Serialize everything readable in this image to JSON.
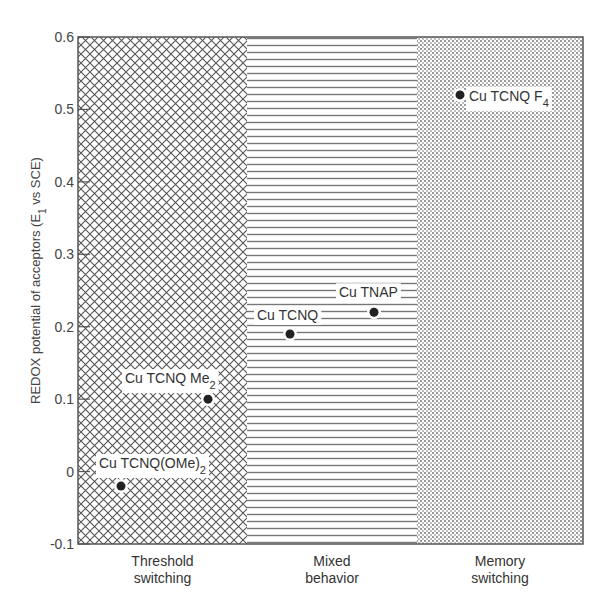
{
  "chart_data": {
    "type": "scatter",
    "title": "",
    "xlabel": "",
    "ylabel": "REDOX potential of acceptors (E1 vs SCE)",
    "ylabel_parts": {
      "main": "REDOX potential of acceptors (E",
      "sub": "1",
      "tail": " vs SCE)"
    },
    "ylim": [
      -0.1,
      0.6
    ],
    "yticks": [
      "0.6",
      "0.5",
      "0.4",
      "0.3",
      "0.2",
      "0.1",
      "0",
      "-0.1"
    ],
    "ytick_values": [
      0.6,
      0.5,
      0.4,
      0.3,
      0.2,
      0.1,
      0,
      -0.1
    ],
    "grid": false,
    "regions": [
      {
        "name": "Threshold switching",
        "line1": "Threshold",
        "line2": "switching",
        "pattern": "crosshatch"
      },
      {
        "name": "Mixed behavior",
        "line1": "Mixed",
        "line2": "behavior",
        "pattern": "horizontal-lines"
      },
      {
        "name": "Memory switching",
        "line1": "Memory",
        "line2": "switching",
        "pattern": "dots"
      }
    ],
    "points": [
      {
        "label": "Cu TCNQ(OMe)2",
        "main": "Cu TCNQ(OMe)",
        "sub": "2",
        "region": "Threshold switching",
        "x_frac": 0.25,
        "y": -0.02
      },
      {
        "label": "Cu TCNQ Me2",
        "main": "Cu TCNQ Me",
        "sub": "2",
        "region": "Threshold switching",
        "x_frac": 0.77,
        "y": 0.1
      },
      {
        "label": "Cu TCNQ",
        "main": "Cu TCNQ",
        "sub": "",
        "region": "Mixed behavior",
        "x_frac": 0.25,
        "y": 0.19
      },
      {
        "label": "Cu TNAP",
        "main": "Cu TNAP",
        "sub": "",
        "region": "Mixed behavior",
        "x_frac": 0.75,
        "y": 0.22
      },
      {
        "label": "Cu TCNQ F4",
        "main": "Cu TCNQ F",
        "sub": "4",
        "region": "Memory switching",
        "x_frac": 0.25,
        "y": 0.52
      }
    ]
  },
  "colors": {
    "frame": "#555555",
    "pattern": "#666666",
    "dot": "#222222",
    "text": "#333333"
  }
}
